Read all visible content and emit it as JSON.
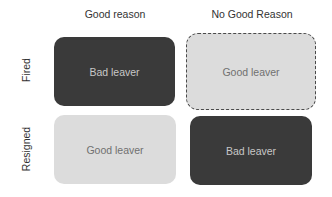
{
  "columns": [
    "Good reason",
    "No Good Reason"
  ],
  "rows": [
    "Fired",
    "Resigned"
  ],
  "cells": [
    {
      "row": "Fired",
      "column": "Good reason",
      "label": "Bad leaver",
      "style": "dark"
    },
    {
      "row": "Fired",
      "column": "No Good Reason",
      "label": "Good leaver",
      "style": "light-dashed"
    },
    {
      "row": "Resigned",
      "column": "Good reason",
      "label": "Good leaver",
      "style": "light"
    },
    {
      "row": "Resigned",
      "column": "No Good Reason",
      "label": "Bad leaver",
      "style": "dark"
    }
  ],
  "colors": {
    "dark": "#3a3a3a",
    "light": "#dcdcdc"
  }
}
